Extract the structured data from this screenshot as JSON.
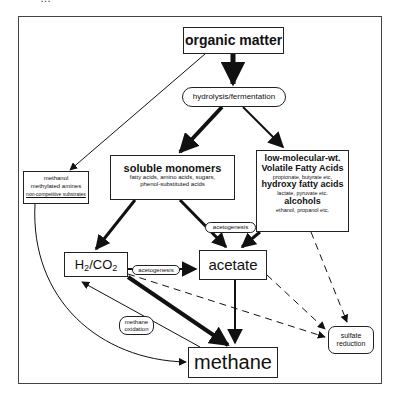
{
  "diagram": {
    "top_clipped_text": "…",
    "nodes": {
      "organic_matter": "organic matter",
      "hydrolysis": "hydrolysis/fermentation",
      "soluble_monomers": {
        "title": "soluble monomers",
        "line1": "fatty acids, amino acids, sugars,",
        "line2": "phenol-substituted acids"
      },
      "lmw": {
        "title1": "low-molecular-wt.",
        "title2": "Volatile Fatty Acids",
        "sub1": "propionate, butyrate etc.",
        "title3": "hydroxy fatty acids",
        "sub2": "lactate, pyruvate etc.",
        "title4": "alcohols",
        "sub3": "ethanol, propanol etc."
      },
      "methanol": {
        "line1": "methanol",
        "line2": "methylated amines",
        "line3": "non-competitive substrates"
      },
      "h2co2": {
        "h": "H",
        "two": "2",
        "co": "/CO",
        "two_b": "2"
      },
      "acetate": "acetate",
      "acetogenesis_top": "acetogenesis",
      "acetogenesis_mid": "acetogenesis",
      "methane_oxidation": {
        "line1": "methane",
        "line2": "oxidation"
      },
      "sulfate_reduction": {
        "line1": "sulfate",
        "line2": "reduction"
      },
      "methane": "methane"
    },
    "edges": [
      {
        "from": "organic matter",
        "to": "hydrolysis/fermentation",
        "style": "thick"
      },
      {
        "from": "organic matter",
        "to": "methanol",
        "style": "thin"
      },
      {
        "from": "hydrolysis/fermentation",
        "to": "soluble monomers",
        "style": "thick"
      },
      {
        "from": "hydrolysis/fermentation",
        "to": "low-molecular-wt.",
        "style": "medium"
      },
      {
        "from": "soluble monomers",
        "to": "H2/CO2",
        "style": "medium"
      },
      {
        "from": "soluble monomers",
        "to": "acetate",
        "style": "medium",
        "label": "acetogenesis"
      },
      {
        "from": "low-molecular-wt.",
        "to": "acetate",
        "style": "medium"
      },
      {
        "from": "low-molecular-wt.",
        "to": "sulfate reduction",
        "style": "dashed"
      },
      {
        "from": "H2/CO2",
        "to": "acetate",
        "style": "medium",
        "label": "acetogenesis"
      },
      {
        "from": "H2/CO2",
        "to": "methane",
        "style": "thick"
      },
      {
        "from": "methane",
        "to": "H2/CO2",
        "style": "thin",
        "label": "methane oxidation"
      },
      {
        "from": "acetate",
        "to": "methane",
        "style": "medium"
      },
      {
        "from": "H2/CO2",
        "to": "sulfate reduction",
        "style": "dashed"
      },
      {
        "from": "acetate",
        "to": "sulfate reduction",
        "style": "dashed"
      },
      {
        "from": "methanol",
        "to": "methane",
        "style": "thin-curve"
      }
    ]
  }
}
